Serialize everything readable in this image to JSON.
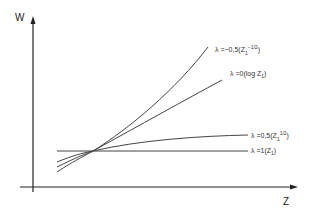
{
  "axes": {
    "y_label": "W",
    "x_label": "Z"
  },
  "curves": [
    {
      "name": "lambda-neg-0.5",
      "label_prefix": "λ =−0,5(Z",
      "label_sub": "1",
      "label_sup": "−1/2",
      "label_suffix": ")"
    },
    {
      "name": "lambda-0",
      "label_prefix": "λ =0(log Z",
      "label_sub": "1",
      "label_sup": "",
      "label_suffix": ")"
    },
    {
      "name": "lambda-0.5",
      "label_prefix": "λ =0,5(Z",
      "label_sub": "1",
      "label_sup": "1/2",
      "label_suffix": ")"
    },
    {
      "name": "lambda-1",
      "label_prefix": "λ =1(Z",
      "label_sub": "1",
      "label_sup": "",
      "label_suffix": ")"
    }
  ],
  "colors": {
    "axis": "#222222",
    "curve": "#444444",
    "text": "#333333"
  }
}
